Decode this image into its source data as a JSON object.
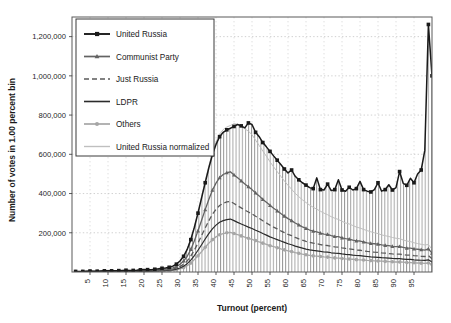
{
  "chart_data": {
    "type": "line",
    "title": "",
    "xlabel": "Turnout (percent)",
    "ylabel": "Number of votes in 1.00 percent bin",
    "xlim": [
      0,
      100
    ],
    "ylim": [
      0,
      1300000
    ],
    "xticks": [
      5,
      10,
      15,
      20,
      25,
      30,
      35,
      40,
      45,
      50,
      55,
      60,
      65,
      70,
      75,
      80,
      85,
      90,
      95
    ],
    "xtick_labels": [
      "5",
      "10",
      "15",
      "20",
      "25",
      "30",
      "35",
      "40",
      "45",
      "50",
      "55",
      "60",
      "65",
      "70",
      "75",
      "80",
      "85",
      "90",
      "95"
    ],
    "yticks": [
      200000,
      400000,
      600000,
      800000,
      1000000,
      1200000
    ],
    "ytick_labels": [
      "200,000",
      "400,000",
      "600,000",
      "800,000",
      "1,000,000",
      "1,200,000"
    ],
    "grid": true,
    "grid_style": "dotted",
    "legend_position": "upper-left",
    "fill_under_first_series": true,
    "fill_pattern": "vertical-hatch",
    "x": [
      1,
      2,
      3,
      4,
      5,
      6,
      7,
      8,
      9,
      10,
      11,
      12,
      13,
      14,
      15,
      16,
      17,
      18,
      19,
      20,
      21,
      22,
      23,
      24,
      25,
      26,
      27,
      28,
      29,
      30,
      31,
      32,
      33,
      34,
      35,
      36,
      37,
      38,
      39,
      40,
      41,
      42,
      43,
      44,
      45,
      46,
      47,
      48,
      49,
      50,
      51,
      52,
      53,
      54,
      55,
      56,
      57,
      58,
      59,
      60,
      61,
      62,
      63,
      64,
      65,
      66,
      67,
      68,
      69,
      70,
      71,
      72,
      73,
      74,
      75,
      76,
      77,
      78,
      79,
      80,
      81,
      82,
      83,
      84,
      85,
      86,
      87,
      88,
      89,
      90,
      91,
      92,
      93,
      94,
      95,
      96,
      97,
      98,
      99,
      100
    ],
    "series": [
      {
        "name": "United Russia",
        "color": "#1a1a1a",
        "style": "solid",
        "width": 1.5,
        "marker": "square",
        "values": [
          3000,
          3000,
          3000,
          4000,
          5000,
          4000,
          4000,
          5000,
          6000,
          7000,
          6000,
          6000,
          7000,
          8000,
          9000,
          8000,
          8000,
          9000,
          11000,
          13000,
          12000,
          12000,
          14000,
          16000,
          19000,
          20000,
          24000,
          30000,
          40000,
          56000,
          80000,
          115000,
          165000,
          228000,
          300000,
          378000,
          455000,
          530000,
          598000,
          650000,
          690000,
          712000,
          725000,
          733000,
          742000,
          752000,
          745000,
          735000,
          760000,
          752000,
          712000,
          690000,
          660000,
          638000,
          615000,
          592000,
          570000,
          548000,
          525000,
          505000,
          520000,
          488000,
          470000,
          455000,
          443000,
          430000,
          425000,
          480000,
          420000,
          418000,
          448000,
          415000,
          420000,
          470000,
          418000,
          412000,
          432000,
          418000,
          425000,
          462000,
          420000,
          412000,
          408000,
          420000,
          455000,
          412000,
          420000,
          445000,
          418000,
          430000,
          512000,
          452000,
          442000,
          478000,
          455000,
          500000,
          520000,
          620000,
          1262000,
          1000000
        ]
      },
      {
        "name": "Communist Party",
        "color": "#636363",
        "style": "solid",
        "width": 1.3,
        "marker": "triangle",
        "values": [
          2200,
          2200,
          2200,
          3000,
          3500,
          3000,
          3000,
          3600,
          4200,
          5000,
          4400,
          4400,
          5000,
          5600,
          6400,
          5800,
          5800,
          6400,
          7800,
          9200,
          8600,
          8600,
          10000,
          11400,
          13500,
          14200,
          17000,
          21000,
          28000,
          39000,
          56000,
          80000,
          115000,
          159000,
          210000,
          264000,
          318000,
          370000,
          417000,
          453000,
          481000,
          497000,
          506000,
          511000,
          495000,
          480000,
          465000,
          449000,
          435000,
          420000,
          403000,
          388000,
          370000,
          355000,
          340000,
          325000,
          312000,
          298000,
          285000,
          272000,
          262000,
          250000,
          240000,
          230000,
          222000,
          214000,
          208000,
          205000,
          198000,
          193000,
          192000,
          186000,
          181000,
          180000,
          174000,
          170000,
          168000,
          163000,
          159000,
          158000,
          153000,
          149000,
          146000,
          144000,
          142000,
          138000,
          136000,
          134000,
          131000,
          129000,
          130000,
          125000,
          122000,
          122000,
          118000,
          116000,
          114000,
          112000,
          118000,
          96000
        ]
      },
      {
        "name": "Just Russia",
        "color": "#5a5a5a",
        "style": "dashed",
        "width": 1.3,
        "marker": "none",
        "values": [
          1600,
          1600,
          1600,
          2100,
          2500,
          2100,
          2100,
          2500,
          3000,
          3500,
          3100,
          3100,
          3500,
          4000,
          4500,
          4100,
          4100,
          4500,
          5500,
          6500,
          6100,
          6100,
          7000,
          8000,
          9500,
          10000,
          12000,
          15000,
          20000,
          27500,
          39500,
          56500,
          81000,
          112000,
          148000,
          186000,
          224000,
          261000,
          294000,
          319000,
          339000,
          350000,
          357000,
          360000,
          349000,
          338000,
          327000,
          316000,
          306000,
          296000,
          284000,
          273000,
          261000,
          250000,
          239000,
          229000,
          220000,
          210000,
          201000,
          192000,
          185000,
          176000,
          169000,
          162000,
          156000,
          151000,
          147000,
          144000,
          140000,
          136000,
          135000,
          131000,
          128000,
          127000,
          123000,
          120000,
          118000,
          115000,
          112000,
          111000,
          108000,
          105000,
          103000,
          101000,
          100000,
          97000,
          96000,
          94000,
          92000,
          91000,
          91000,
          88000,
          86000,
          86000,
          83000,
          82000,
          80000,
          79000,
          83000,
          68000
        ]
      },
      {
        "name": "LDPR",
        "color": "#2b2b2b",
        "style": "solid",
        "width": 1.2,
        "marker": "none",
        "values": [
          1200,
          1200,
          1200,
          1600,
          1900,
          1600,
          1600,
          1900,
          2200,
          2600,
          2300,
          2300,
          2600,
          3000,
          3400,
          3100,
          3100,
          3400,
          4100,
          4900,
          4600,
          4600,
          5300,
          6000,
          7100,
          7500,
          9000,
          11200,
          15000,
          20600,
          29600,
          42400,
          60700,
          84000,
          111000,
          139000,
          168000,
          196000,
          220000,
          239000,
          254000,
          262000,
          267000,
          270000,
          262000,
          253000,
          245000,
          237000,
          229000,
          222000,
          213000,
          205000,
          196000,
          188000,
          179000,
          172000,
          165000,
          158000,
          151000,
          144000,
          139000,
          132000,
          127000,
          122000,
          117000,
          113000,
          110000,
          108000,
          105000,
          102000,
          101000,
          98000,
          96000,
          95000,
          92000,
          90000,
          89000,
          86000,
          84000,
          83000,
          81000,
          79000,
          77000,
          76000,
          75000,
          73000,
          72000,
          71000,
          69000,
          68000,
          68000,
          66000,
          64000,
          64000,
          62000,
          61000,
          60000,
          59000,
          62000,
          51000
        ]
      },
      {
        "name": "Others",
        "color": "#a6a6a6",
        "style": "solid",
        "width": 1.3,
        "marker": "circle",
        "values": [
          900,
          900,
          900,
          1200,
          1400,
          1200,
          1200,
          1400,
          1650,
          1950,
          1700,
          1700,
          1950,
          2250,
          2550,
          2300,
          2300,
          2550,
          3100,
          3650,
          3450,
          3450,
          3950,
          4500,
          5350,
          5600,
          6750,
          8400,
          11200,
          15400,
          22200,
          31800,
          45500,
          63000,
          83000,
          104000,
          126000,
          147000,
          165000,
          179000,
          190000,
          196000,
          200000,
          202000,
          196000,
          190000,
          184000,
          178000,
          172000,
          166000,
          160000,
          153000,
          147000,
          141000,
          134000,
          129000,
          124000,
          118000,
          113000,
          108000,
          104000,
          99000,
          95000,
          91000,
          88000,
          85000,
          82000,
          81000,
          79000,
          77000,
          76000,
          73000,
          72000,
          71000,
          69000,
          67000,
          66000,
          65000,
          63000,
          62000,
          61000,
          59000,
          58000,
          57000,
          56000,
          55000,
          54000,
          53000,
          52000,
          51000,
          51000,
          50000,
          48000,
          48000,
          47000,
          46000,
          45000,
          44000,
          46000,
          38000
        ]
      },
      {
        "name": "United Russia normalized",
        "color": "#bfbfbf",
        "style": "solid",
        "width": 1.0,
        "marker": "none",
        "values": [
          3000,
          3000,
          3000,
          4000,
          5000,
          4000,
          4000,
          5000,
          6000,
          7000,
          6000,
          6000,
          7000,
          8000,
          9000,
          8000,
          8000,
          9000,
          11000,
          13000,
          12000,
          12000,
          14000,
          16000,
          19000,
          20000,
          24000,
          30000,
          40000,
          56000,
          81000,
          117000,
          168000,
          232000,
          305000,
          385000,
          464000,
          540000,
          609000,
          662000,
          703000,
          726000,
          739000,
          747000,
          756000,
          753000,
          742000,
          730000,
          718000,
          700000,
          672000,
          645000,
          617000,
          590000,
          562000,
          536000,
          512000,
          488000,
          464000,
          442000,
          422000,
          401000,
          384000,
          368000,
          354000,
          341000,
          330000,
          320000,
          310000,
          300000,
          292000,
          282000,
          274000,
          268000,
          258000,
          250000,
          245000,
          237000,
          229000,
          224000,
          217000,
          211000,
          205000,
          200000,
          196000,
          189000,
          185000,
          181000,
          176000,
          172000,
          170000,
          163000,
          158000,
          155000,
          149000,
          145000,
          141000,
          138000,
          140000,
          116000
        ]
      }
    ]
  },
  "legend": {
    "items": [
      {
        "label": "United Russia"
      },
      {
        "label": "Communist Party"
      },
      {
        "label": "Just Russia"
      },
      {
        "label": "LDPR"
      },
      {
        "label": "Others"
      },
      {
        "label": "United Russia normalized"
      }
    ]
  },
  "axes": {
    "x_title": "Turnout (percent)",
    "y_title": "Number of votes in 1.00 percent bin"
  }
}
